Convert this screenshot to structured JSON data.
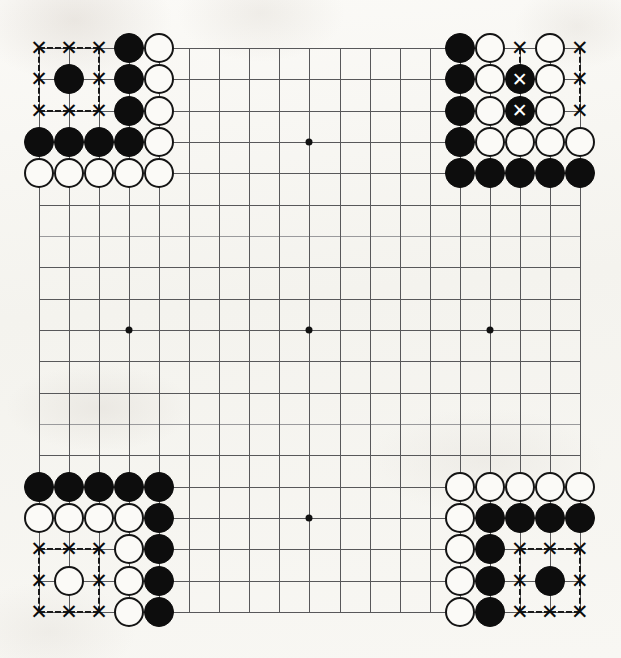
{
  "diagram": {
    "type": "go-board-problem-diagram",
    "board_size": 19,
    "colors": {
      "background": "#f7f6f2",
      "grid_line": "#58585a",
      "black_stone": "#0d0d0d",
      "white_stone": "#fbfaf7",
      "white_stone_outline": "#141414",
      "mark_color": "#0d0d0d",
      "mark_on_black_color": "#ffffff"
    },
    "geometry": {
      "left_px": 39,
      "top_px": 48,
      "col_spacing_px": 30.05,
      "row_spacing_px": 31.33,
      "stone_diameter_px": 30,
      "mark_glyph": "✕",
      "mark_glyph_label": "x-mark"
    },
    "star_points": [
      {
        "col": 3,
        "row": 3
      },
      {
        "col": 9,
        "row": 3
      },
      {
        "col": 15,
        "row": 3
      },
      {
        "col": 3,
        "row": 9
      },
      {
        "col": 9,
        "row": 9
      },
      {
        "col": 15,
        "row": 9
      },
      {
        "col": 3,
        "row": 15
      },
      {
        "col": 9,
        "row": 15
      },
      {
        "col": 15,
        "row": 15
      }
    ],
    "groups": [
      {
        "name": "top-left-corner",
        "stones": [
          {
            "col": 3,
            "row": 0,
            "color": "black"
          },
          {
            "col": 4,
            "row": 0,
            "color": "white"
          },
          {
            "col": 1,
            "row": 1,
            "color": "black"
          },
          {
            "col": 3,
            "row": 1,
            "color": "black"
          },
          {
            "col": 4,
            "row": 1,
            "color": "white"
          },
          {
            "col": 3,
            "row": 2,
            "color": "black"
          },
          {
            "col": 4,
            "row": 2,
            "color": "white"
          },
          {
            "col": 0,
            "row": 3,
            "color": "black"
          },
          {
            "col": 1,
            "row": 3,
            "color": "black"
          },
          {
            "col": 2,
            "row": 3,
            "color": "black"
          },
          {
            "col": 3,
            "row": 3,
            "color": "black"
          },
          {
            "col": 4,
            "row": 3,
            "color": "white"
          },
          {
            "col": 0,
            "row": 4,
            "color": "white"
          },
          {
            "col": 1,
            "row": 4,
            "color": "white"
          },
          {
            "col": 2,
            "row": 4,
            "color": "white"
          },
          {
            "col": 3,
            "row": 4,
            "color": "white"
          },
          {
            "col": 4,
            "row": 4,
            "color": "white"
          }
        ],
        "marks": [
          {
            "col": 0,
            "row": 0
          },
          {
            "col": 1,
            "row": 0
          },
          {
            "col": 2,
            "row": 0
          },
          {
            "col": 0,
            "row": 1
          },
          {
            "col": 2,
            "row": 1
          },
          {
            "col": 0,
            "row": 2
          },
          {
            "col": 1,
            "row": 2
          },
          {
            "col": 2,
            "row": 2
          }
        ]
      },
      {
        "name": "top-right-corner",
        "stones": [
          {
            "col": 14,
            "row": 0,
            "color": "black"
          },
          {
            "col": 15,
            "row": 0,
            "color": "white"
          },
          {
            "col": 17,
            "row": 0,
            "color": "white"
          },
          {
            "col": 14,
            "row": 1,
            "color": "black"
          },
          {
            "col": 15,
            "row": 1,
            "color": "white"
          },
          {
            "col": 16,
            "row": 1,
            "color": "black",
            "mark": true
          },
          {
            "col": 17,
            "row": 1,
            "color": "white"
          },
          {
            "col": 14,
            "row": 2,
            "color": "black"
          },
          {
            "col": 15,
            "row": 2,
            "color": "white"
          },
          {
            "col": 16,
            "row": 2,
            "color": "black",
            "mark": true
          },
          {
            "col": 17,
            "row": 2,
            "color": "white"
          },
          {
            "col": 14,
            "row": 3,
            "color": "black"
          },
          {
            "col": 15,
            "row": 3,
            "color": "white"
          },
          {
            "col": 16,
            "row": 3,
            "color": "white"
          },
          {
            "col": 17,
            "row": 3,
            "color": "white"
          },
          {
            "col": 18,
            "row": 3,
            "color": "white"
          },
          {
            "col": 14,
            "row": 4,
            "color": "black"
          },
          {
            "col": 15,
            "row": 4,
            "color": "black"
          },
          {
            "col": 16,
            "row": 4,
            "color": "black"
          },
          {
            "col": 17,
            "row": 4,
            "color": "black"
          },
          {
            "col": 18,
            "row": 4,
            "color": "black"
          }
        ],
        "marks": [
          {
            "col": 16,
            "row": 0
          },
          {
            "col": 18,
            "row": 0
          },
          {
            "col": 18,
            "row": 1
          },
          {
            "col": 18,
            "row": 2
          }
        ]
      },
      {
        "name": "bottom-left-corner",
        "stones": [
          {
            "col": 0,
            "row": 14,
            "color": "black"
          },
          {
            "col": 1,
            "row": 14,
            "color": "black"
          },
          {
            "col": 2,
            "row": 14,
            "color": "black"
          },
          {
            "col": 3,
            "row": 14,
            "color": "black"
          },
          {
            "col": 4,
            "row": 14,
            "color": "black"
          },
          {
            "col": 0,
            "row": 15,
            "color": "white"
          },
          {
            "col": 1,
            "row": 15,
            "color": "white"
          },
          {
            "col": 2,
            "row": 15,
            "color": "white"
          },
          {
            "col": 3,
            "row": 15,
            "color": "white"
          },
          {
            "col": 4,
            "row": 15,
            "color": "black"
          },
          {
            "col": 3,
            "row": 16,
            "color": "white"
          },
          {
            "col": 4,
            "row": 16,
            "color": "black"
          },
          {
            "col": 1,
            "row": 17,
            "color": "white"
          },
          {
            "col": 3,
            "row": 17,
            "color": "white"
          },
          {
            "col": 4,
            "row": 17,
            "color": "black"
          },
          {
            "col": 3,
            "row": 18,
            "color": "white"
          },
          {
            "col": 4,
            "row": 18,
            "color": "black"
          }
        ],
        "marks": [
          {
            "col": 0,
            "row": 16
          },
          {
            "col": 1,
            "row": 16
          },
          {
            "col": 2,
            "row": 16
          },
          {
            "col": 0,
            "row": 17
          },
          {
            "col": 2,
            "row": 17
          },
          {
            "col": 0,
            "row": 18
          },
          {
            "col": 1,
            "row": 18
          },
          {
            "col": 2,
            "row": 18
          }
        ]
      },
      {
        "name": "bottom-right-corner",
        "stones": [
          {
            "col": 14,
            "row": 14,
            "color": "white"
          },
          {
            "col": 15,
            "row": 14,
            "color": "white"
          },
          {
            "col": 16,
            "row": 14,
            "color": "white"
          },
          {
            "col": 17,
            "row": 14,
            "color": "white"
          },
          {
            "col": 18,
            "row": 14,
            "color": "white"
          },
          {
            "col": 14,
            "row": 15,
            "color": "white"
          },
          {
            "col": 15,
            "row": 15,
            "color": "black"
          },
          {
            "col": 16,
            "row": 15,
            "color": "black"
          },
          {
            "col": 17,
            "row": 15,
            "color": "black"
          },
          {
            "col": 18,
            "row": 15,
            "color": "black"
          },
          {
            "col": 14,
            "row": 16,
            "color": "white"
          },
          {
            "col": 15,
            "row": 16,
            "color": "black"
          },
          {
            "col": 14,
            "row": 17,
            "color": "white"
          },
          {
            "col": 15,
            "row": 17,
            "color": "black"
          },
          {
            "col": 17,
            "row": 17,
            "color": "black"
          },
          {
            "col": 14,
            "row": 18,
            "color": "white"
          },
          {
            "col": 15,
            "row": 18,
            "color": "black"
          }
        ],
        "marks": [
          {
            "col": 16,
            "row": 16
          },
          {
            "col": 17,
            "row": 16
          },
          {
            "col": 18,
            "row": 16
          },
          {
            "col": 16,
            "row": 17
          },
          {
            "col": 18,
            "row": 17
          },
          {
            "col": 16,
            "row": 18
          },
          {
            "col": 17,
            "row": 18
          },
          {
            "col": 18,
            "row": 18
          }
        ]
      }
    ]
  }
}
